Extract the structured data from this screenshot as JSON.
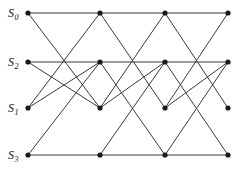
{
  "diagram": {
    "type": "butterfly-interconnection-network",
    "title": "",
    "background_color": "#ffffff",
    "edge_color": "#3a3a3a",
    "node_color": "#1a1a1a",
    "node_radius": 2.6,
    "columns_x": [
      28,
      100,
      165,
      228
    ],
    "rows_y": [
      13,
      62,
      108,
      155
    ],
    "row_labels": [
      {
        "base": "S",
        "sub": "0",
        "x": 8,
        "y": 17
      },
      {
        "base": "S",
        "sub": "2",
        "x": 8,
        "y": 66
      },
      {
        "base": "S",
        "sub": "1",
        "x": 8,
        "y": 112
      },
      {
        "base": "S",
        "sub": "3",
        "x": 8,
        "y": 159
      }
    ],
    "nodes": [
      {
        "id": "c0r0",
        "x": 28,
        "y": 13
      },
      {
        "id": "c0r1",
        "x": 28,
        "y": 62
      },
      {
        "id": "c0r2",
        "x": 28,
        "y": 108
      },
      {
        "id": "c0r3",
        "x": 28,
        "y": 155
      },
      {
        "id": "c1r0",
        "x": 100,
        "y": 13
      },
      {
        "id": "c1r1",
        "x": 100,
        "y": 62
      },
      {
        "id": "c1r2",
        "x": 100,
        "y": 108
      },
      {
        "id": "c1r3",
        "x": 100,
        "y": 155
      },
      {
        "id": "c2r0",
        "x": 165,
        "y": 13
      },
      {
        "id": "c2r1",
        "x": 165,
        "y": 62
      },
      {
        "id": "c2r2",
        "x": 165,
        "y": 108
      },
      {
        "id": "c2r3",
        "x": 165,
        "y": 155
      },
      {
        "id": "c3r0",
        "x": 228,
        "y": 13
      },
      {
        "id": "c3r1",
        "x": 228,
        "y": 62
      },
      {
        "id": "c3r2",
        "x": 228,
        "y": 108
      },
      {
        "id": "c3r3",
        "x": 228,
        "y": 155
      }
    ],
    "edges": [
      {
        "from": "c0r0",
        "to": "c1r0"
      },
      {
        "from": "c0r0",
        "to": "c1r2"
      },
      {
        "from": "c0r1",
        "to": "c1r1"
      },
      {
        "from": "c0r1",
        "to": "c1r2"
      },
      {
        "from": "c0r2",
        "to": "c1r1"
      },
      {
        "from": "c0r2",
        "to": "c1r0"
      },
      {
        "from": "c0r3",
        "to": "c1r3"
      },
      {
        "from": "c0r3",
        "to": "c1r1"
      },
      {
        "from": "c1r0",
        "to": "c2r0"
      },
      {
        "from": "c1r0",
        "to": "c2r2"
      },
      {
        "from": "c1r1",
        "to": "c2r1"
      },
      {
        "from": "c1r1",
        "to": "c2r3"
      },
      {
        "from": "c1r2",
        "to": "c2r1"
      },
      {
        "from": "c1r2",
        "to": "c2r0"
      },
      {
        "from": "c1r3",
        "to": "c2r3"
      },
      {
        "from": "c1r3",
        "to": "c2r1"
      },
      {
        "from": "c2r0",
        "to": "c3r0"
      },
      {
        "from": "c2r0",
        "to": "c3r2"
      },
      {
        "from": "c2r1",
        "to": "c3r1"
      },
      {
        "from": "c2r1",
        "to": "c3r3"
      },
      {
        "from": "c2r2",
        "to": "c3r1"
      },
      {
        "from": "c2r2",
        "to": "c3r0"
      },
      {
        "from": "c2r3",
        "to": "c3r3"
      },
      {
        "from": "c2r3",
        "to": "c3r1"
      }
    ]
  }
}
